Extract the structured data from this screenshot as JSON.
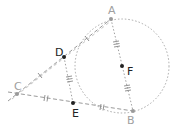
{
  "diagram": {
    "title": "",
    "colors": {
      "line": "#9a9a9a",
      "circle": "#a8a8a8",
      "point_dark": "#222222",
      "point_light": "#9a9a9a",
      "label_dark": "#222222",
      "label_light": "#a0a0a0"
    },
    "points": [
      {
        "id": "A",
        "label": "A",
        "x": 111,
        "y": 19,
        "style": "light"
      },
      {
        "id": "B",
        "label": "B",
        "x": 133,
        "y": 111,
        "style": "light"
      },
      {
        "id": "C",
        "label": "C",
        "x": 17,
        "y": 94,
        "style": "light"
      },
      {
        "id": "D",
        "label": "D",
        "x": 64,
        "y": 57,
        "style": "dark"
      },
      {
        "id": "E",
        "label": "E",
        "x": 73,
        "y": 103,
        "style": "dark"
      },
      {
        "id": "F",
        "label": "F",
        "x": 122,
        "y": 66,
        "style": "dark"
      }
    ],
    "circle": {
      "center": "F",
      "radius": 47
    },
    "segments": [
      {
        "from": "C",
        "to": "A",
        "ticks": 0
      },
      {
        "from": "C",
        "to": "D",
        "ticks": 1
      },
      {
        "from": "D",
        "to": "A",
        "ticks": 1
      },
      {
        "from": "C",
        "to": "E",
        "ticks": 2
      },
      {
        "from": "E",
        "to": "B",
        "ticks": 2
      },
      {
        "from": "D",
        "to": "E",
        "ticks": 3
      },
      {
        "from": "A",
        "to": "F",
        "ticks": 3
      },
      {
        "from": "F",
        "to": "B",
        "ticks": 3
      }
    ],
    "relations": [
      "CD = DA",
      "CE = EB",
      "AF = FB = DE"
    ]
  }
}
